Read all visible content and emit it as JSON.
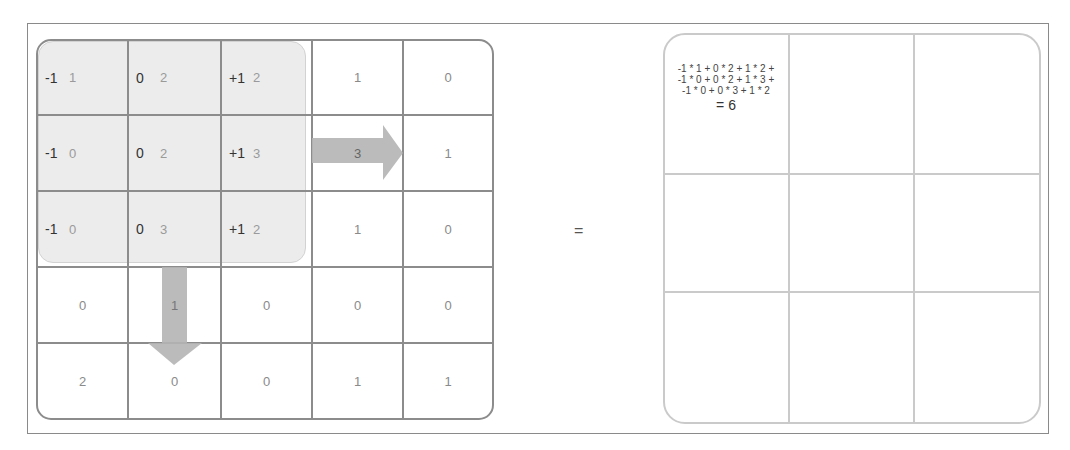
{
  "diagram": {
    "title_fragment": "g                                   g",
    "equals_sign": "=",
    "input_grid": {
      "rows": 5,
      "cols": 5,
      "cells": [
        [
          {
            "weight": "-1",
            "value": "1"
          },
          {
            "weight": "0",
            "value": "2"
          },
          {
            "weight": "+1",
            "value": "2"
          },
          {
            "value": "1"
          },
          {
            "value": "0"
          }
        ],
        [
          {
            "weight": "-1",
            "value": "0"
          },
          {
            "weight": "0",
            "value": "2"
          },
          {
            "weight": "+1",
            "value": "3"
          },
          {
            "value": "3"
          },
          {
            "value": "1"
          }
        ],
        [
          {
            "weight": "-1",
            "value": "0"
          },
          {
            "weight": "0",
            "value": "3"
          },
          {
            "weight": "+1",
            "value": "2"
          },
          {
            "value": "1"
          },
          {
            "value": "0"
          }
        ],
        [
          {
            "value": "0"
          },
          {
            "value": "1"
          },
          {
            "value": "0"
          },
          {
            "value": "0"
          },
          {
            "value": "0"
          }
        ],
        [
          {
            "value": "2"
          },
          {
            "value": "0"
          },
          {
            "value": "0"
          },
          {
            "value": "1"
          },
          {
            "value": "1"
          }
        ]
      ],
      "kernel": {
        "position": "top-left 3x3",
        "weights": [
          [
            "-1",
            "0",
            "+1"
          ],
          [
            "-1",
            "0",
            "+1"
          ],
          [
            "-1",
            "0",
            "+1"
          ]
        ]
      },
      "arrows": [
        {
          "direction": "right",
          "meaning": "slide kernel horizontally"
        },
        {
          "direction": "down",
          "meaning": "slide kernel vertically"
        }
      ]
    },
    "output_grid": {
      "rows": 3,
      "cols": 3,
      "formula_lines": [
        "-1 * 1 + 0 * 2 + 1 * 2 +",
        "-1 * 0 + 0 * 2 + 1 * 3 +",
        "-1 * 0 + 0 * 3 + 1 * 2"
      ],
      "result": "= 6"
    },
    "colors": {
      "grid_border": "#8c8c8c",
      "output_border": "#cacaca",
      "kernel_highlight": "#ececec",
      "arrow": "#b4b4b4",
      "weight_text": "#333333",
      "value_text": "#9a9a9a"
    }
  }
}
